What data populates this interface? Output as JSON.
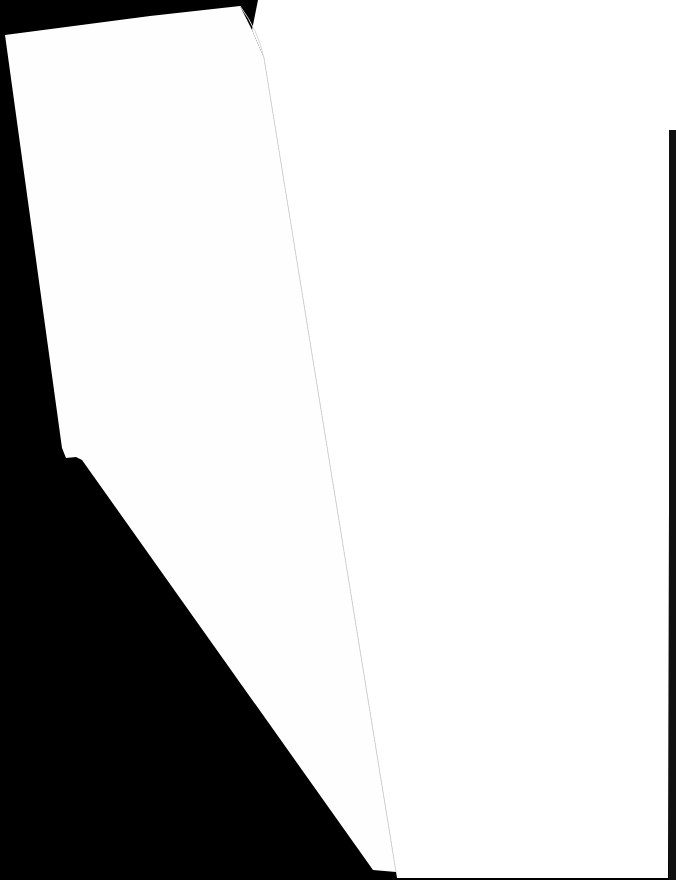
{
  "scene": {
    "description": "Blank white paper sheets over a black background",
    "background_color": "#000000",
    "sheets": [
      {
        "name": "left-sheet",
        "color": "#fefefe"
      },
      {
        "name": "right-sheet",
        "color": "#ffffff"
      }
    ],
    "visible_text": []
  }
}
